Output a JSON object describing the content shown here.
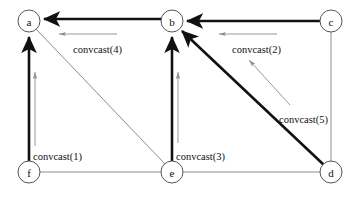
{
  "figure": {
    "background_color": "#ffffff",
    "tree_edge_color": "#111111",
    "plain_edge_color": "#8d8d8d",
    "annotation_color": "#8d8d8d",
    "width": 361,
    "height": 198
  },
  "nodes": [
    {
      "id": "a",
      "label": "a",
      "x": 29,
      "y": 21,
      "r": 11
    },
    {
      "id": "b",
      "label": "b",
      "x": 172,
      "y": 21,
      "r": 11
    },
    {
      "id": "c",
      "label": "c",
      "x": 331,
      "y": 21,
      "r": 11
    },
    {
      "id": "d",
      "label": "d",
      "x": 331,
      "y": 172,
      "r": 11
    },
    {
      "id": "e",
      "label": "e",
      "x": 172,
      "y": 172,
      "r": 11
    },
    {
      "id": "f",
      "label": "f",
      "x": 29,
      "y": 172,
      "r": 11
    }
  ],
  "plain_edges": [
    {
      "from": "a",
      "to": "e",
      "kind": "diagonal"
    },
    {
      "from": "f",
      "to": "e",
      "kind": "horizontal"
    },
    {
      "from": "e",
      "to": "d",
      "kind": "horizontal"
    },
    {
      "from": "c",
      "to": "d",
      "kind": "vertical"
    }
  ],
  "tree_edges": [
    {
      "from": "c",
      "to": "b",
      "directed": true,
      "label": "convcast(2)"
    },
    {
      "from": "b",
      "to": "a",
      "directed": true,
      "label": "convcast(4)"
    },
    {
      "from": "f",
      "to": "a",
      "directed": true,
      "label": "convcast(1)"
    },
    {
      "from": "e",
      "to": "b",
      "directed": true,
      "label": "convcast(3)"
    },
    {
      "from": "d",
      "to": "b",
      "directed": true,
      "label": "convcast(5)"
    }
  ],
  "annotations": [
    {
      "id": "convcast1",
      "text": "convcast(1)",
      "x": 33,
      "y": 156,
      "direction": "up"
    },
    {
      "id": "convcast2",
      "text": "convcast(2)",
      "x": 232,
      "y": 49,
      "direction": "left"
    },
    {
      "id": "convcast3",
      "text": "convcast(3)",
      "x": 176,
      "y": 156,
      "direction": "up"
    },
    {
      "id": "convcast4",
      "text": "convcast(4)",
      "x": 73,
      "y": 49,
      "direction": "left"
    },
    {
      "id": "convcast5",
      "text": "convcast(5)",
      "x": 279,
      "y": 119,
      "direction": "up-left"
    }
  ]
}
